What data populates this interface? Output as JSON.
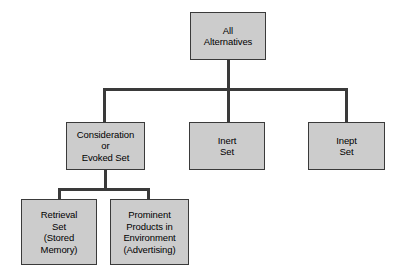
{
  "diagram": {
    "colors": {
      "box_fill": "#cccccc",
      "box_border": "#3a3a3a",
      "connector": "#3a3a3a",
      "text": "#000000",
      "background": "#ffffff"
    },
    "nodes": {
      "root": {
        "id": "all-alternatives",
        "label": "All\nAlternatives",
        "lines": [
          "All",
          "Alternatives"
        ]
      },
      "consideration": {
        "id": "consideration-or-evoked-set",
        "label": "Consideration\nor\nEvoked Set",
        "lines": [
          "Consideration",
          "or",
          "Evoked Set"
        ]
      },
      "inert": {
        "id": "inert-set",
        "label": "Inert\nSet",
        "lines": [
          "Inert",
          "Set"
        ]
      },
      "inept": {
        "id": "inept-set",
        "label": "Inept\nSet",
        "lines": [
          "Inept",
          "Set"
        ]
      },
      "retrieval": {
        "id": "retrieval-set",
        "label": "Retrieval\nSet\n(Stored\nMemory)",
        "lines": [
          "Retrieval",
          "Set",
          "(Stored",
          "Memory)"
        ]
      },
      "prominent": {
        "id": "prominent-products-in-environment",
        "label": "Prominent\nProducts in\nEnvironment\n(Advertising)",
        "lines": [
          "Prominent",
          "Products in",
          "Environment",
          "(Advertising)"
        ]
      }
    },
    "edges": [
      {
        "from": "all-alternatives",
        "to": "consideration-or-evoked-set"
      },
      {
        "from": "all-alternatives",
        "to": "inert-set"
      },
      {
        "from": "all-alternatives",
        "to": "inept-set"
      },
      {
        "from": "consideration-or-evoked-set",
        "to": "retrieval-set"
      },
      {
        "from": "consideration-or-evoked-set",
        "to": "prominent-products-in-environment"
      }
    ]
  }
}
